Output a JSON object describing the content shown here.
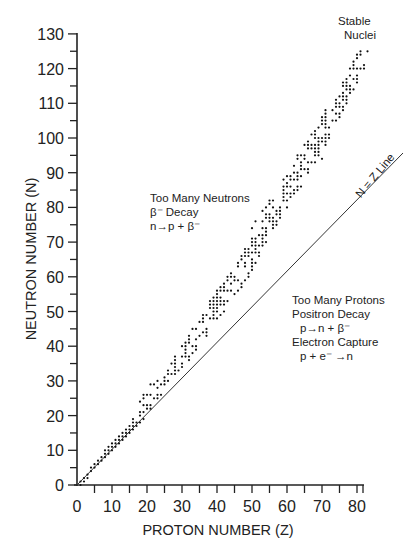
{
  "chart_data": {
    "type": "scatter",
    "title": "",
    "xlabel": "PROTON NUMBER (Z)",
    "ylabel": "NEUTRON NUMBER (N)",
    "xlim": [
      0,
      82
    ],
    "ylim": [
      0,
      130
    ],
    "grid": false,
    "legend": null,
    "x_ticks": [
      0,
      10,
      20,
      30,
      40,
      50,
      60,
      70,
      80
    ],
    "x_minor_step": 5,
    "y_ticks": [
      0,
      10,
      20,
      30,
      40,
      50,
      60,
      70,
      80,
      90,
      100,
      110,
      120,
      130
    ],
    "y_minor_step": 5,
    "series": [
      {
        "name": "Stable Nuclei",
        "marker": "dot",
        "description": "Band of stable nuclei; N range per Z (approximate)",
        "band": [
          {
            "z": 1,
            "n_min": 0,
            "n_max": 1
          },
          {
            "z": 2,
            "n_min": 1,
            "n_max": 2
          },
          {
            "z": 5,
            "n_min": 5,
            "n_max": 6
          },
          {
            "z": 10,
            "n_min": 10,
            "n_max": 12
          },
          {
            "z": 15,
            "n_min": 15,
            "n_max": 17
          },
          {
            "z": 20,
            "n_min": 20,
            "n_max": 28
          },
          {
            "z": 25,
            "n_min": 28,
            "n_max": 32
          },
          {
            "z": 30,
            "n_min": 34,
            "n_max": 40
          },
          {
            "z": 35,
            "n_min": 40,
            "n_max": 48
          },
          {
            "z": 40,
            "n_min": 48,
            "n_max": 56
          },
          {
            "z": 45,
            "n_min": 54,
            "n_max": 62
          },
          {
            "z": 50,
            "n_min": 62,
            "n_max": 74
          },
          {
            "z": 55,
            "n_min": 72,
            "n_max": 82
          },
          {
            "z": 60,
            "n_min": 80,
            "n_max": 90
          },
          {
            "z": 65,
            "n_min": 88,
            "n_max": 98
          },
          {
            "z": 70,
            "n_min": 94,
            "n_max": 106
          },
          {
            "z": 75,
            "n_min": 106,
            "n_max": 114
          },
          {
            "z": 80,
            "n_min": 116,
            "n_max": 124
          },
          {
            "z": 83,
            "n_min": 122,
            "n_max": 126
          }
        ]
      },
      {
        "name": "N = Z Line",
        "type": "line",
        "points": [
          [
            0,
            0
          ],
          [
            93,
            95.7
          ]
        ]
      }
    ],
    "annotations": [
      {
        "text": [
          "Stable",
          "Nuclei"
        ],
        "anchor_pixel": [
          372,
          27
        ]
      },
      {
        "text": [
          "Too Many Neutrons",
          "β⁻ Decay",
          "n→p + β⁻"
        ],
        "anchor_pixel": [
          152,
          198
        ]
      },
      {
        "text": [
          "N = Z Line"
        ],
        "rotated_deg": -50,
        "anchor_pixel": [
          372,
          165
        ]
      },
      {
        "text": [
          "Too Many Protons",
          "Positron Decay",
          "p→n + β⁺",
          "Electron Capture",
          "p + e⁻ →n"
        ],
        "anchor_pixel": [
          283,
          338
        ]
      }
    ]
  },
  "labels": {
    "x_axis_title": "PROTON NUMBER (Z)",
    "y_axis_title": "NEUTRON NUMBER (N)",
    "stable_1": "Stable",
    "stable_2": "Nuclei",
    "neutrons_1": "Too Many Neutrons",
    "neutrons_2": "β⁻  Decay",
    "neutrons_3": "n→p + β⁻",
    "nz_line": "N = Z Line",
    "protons_1": "Too Many Protons",
    "protons_2": "Positron Decay",
    "protons_3": "p→n + β⁻",
    "protons_4": "Electron Capture",
    "protons_5": "p + e⁻ →n"
  }
}
